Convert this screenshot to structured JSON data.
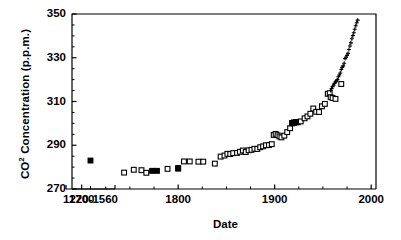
{
  "chart_data": {
    "type": "scatter",
    "title": "",
    "xlabel": "Date",
    "ylabel": "CO2 Concentration (p.p.m.)",
    "ylabel_parts": {
      "prefix": "CO",
      "superscript": "2",
      "suffix": " Concentration (p.p.m.)"
    },
    "ylim": [
      270,
      350
    ],
    "yticks": [
      270,
      290,
      310,
      330,
      350
    ],
    "ytick_labels": [
      "270",
      "290",
      "310",
      "330",
      "350"
    ],
    "xlim": [
      1690,
      2005
    ],
    "xticks": [
      1700,
      1800,
      1900,
      2000
    ],
    "xtick_labels": [
      "1700",
      "1800",
      "1900",
      "2000"
    ],
    "x_minor_ticks": [
      1725,
      1750,
      1775,
      1825,
      1850,
      1875,
      1925,
      1950,
      1975
    ],
    "broken_axis": true,
    "inset_axis_label": "1220-1560",
    "inset_xlim": [
      1220,
      1560
    ],
    "grid": false,
    "legend": "none",
    "series": [
      {
        "name": "Ice core (medieval, 1220-1560)",
        "marker": "filled-square",
        "axis": "inset",
        "points": [
          {
            "x": 1390,
            "y": 283.0
          }
        ]
      },
      {
        "name": "Ice core (open squares)",
        "marker": "open-square",
        "axis": "main",
        "points": [
          {
            "x": 1744,
            "y": 277.5
          },
          {
            "x": 1754,
            "y": 278.8
          },
          {
            "x": 1762,
            "y": 278.6
          },
          {
            "x": 1767,
            "y": 277.4
          },
          {
            "x": 1789,
            "y": 279.2
          },
          {
            "x": 1800,
            "y": 279.6
          },
          {
            "x": 1806,
            "y": 282.6
          },
          {
            "x": 1812,
            "y": 282.6
          },
          {
            "x": 1821,
            "y": 282.5
          },
          {
            "x": 1826,
            "y": 282.5
          },
          {
            "x": 1838,
            "y": 281.6
          },
          {
            "x": 1844,
            "y": 284.8
          },
          {
            "x": 1848,
            "y": 285.3
          },
          {
            "x": 1851,
            "y": 286.1
          },
          {
            "x": 1854,
            "y": 286.0
          },
          {
            "x": 1857,
            "y": 286.4
          },
          {
            "x": 1861,
            "y": 286.5
          },
          {
            "x": 1864,
            "y": 287.0
          },
          {
            "x": 1867,
            "y": 287.6
          },
          {
            "x": 1870,
            "y": 286.9
          },
          {
            "x": 1873,
            "y": 287.7
          },
          {
            "x": 1876,
            "y": 287.9
          },
          {
            "x": 1879,
            "y": 288.4
          },
          {
            "x": 1882,
            "y": 288.3
          },
          {
            "x": 1885,
            "y": 289.1
          },
          {
            "x": 1888,
            "y": 289.5
          },
          {
            "x": 1891,
            "y": 290.0
          },
          {
            "x": 1894,
            "y": 290.1
          },
          {
            "x": 1897,
            "y": 290.5
          },
          {
            "x": 1899,
            "y": 294.7
          },
          {
            "x": 1901,
            "y": 295.2
          },
          {
            "x": 1903,
            "y": 294.6
          },
          {
            "x": 1905,
            "y": 294.0
          },
          {
            "x": 1907,
            "y": 293.6
          },
          {
            "x": 1910,
            "y": 294.4
          },
          {
            "x": 1913,
            "y": 296.0
          },
          {
            "x": 1916,
            "y": 297.8
          },
          {
            "x": 1918,
            "y": 300.0
          },
          {
            "x": 1920,
            "y": 300.4
          },
          {
            "x": 1922,
            "y": 300.6
          },
          {
            "x": 1924,
            "y": 300.5
          },
          {
            "x": 1927,
            "y": 300.9
          },
          {
            "x": 1931,
            "y": 302.3
          },
          {
            "x": 1934,
            "y": 303.2
          },
          {
            "x": 1937,
            "y": 304.4
          },
          {
            "x": 1940,
            "y": 306.8
          },
          {
            "x": 1943,
            "y": 305.3
          },
          {
            "x": 1946,
            "y": 305.2
          },
          {
            "x": 1949,
            "y": 307.8
          },
          {
            "x": 1952,
            "y": 308.9
          },
          {
            "x": 1955,
            "y": 313.5
          },
          {
            "x": 1957,
            "y": 313.8
          },
          {
            "x": 1958,
            "y": 312.0
          },
          {
            "x": 1960,
            "y": 311.6
          },
          {
            "x": 1963,
            "y": 311.2
          },
          {
            "x": 1969,
            "y": 318.0
          }
        ]
      },
      {
        "name": "Ice core (filled squares)",
        "marker": "filled-square",
        "axis": "main",
        "points": [
          {
            "x": 1773,
            "y": 278.3
          },
          {
            "x": 1778,
            "y": 278.3
          },
          {
            "x": 1800,
            "y": 279.3
          },
          {
            "x": 1918,
            "y": 300.2
          },
          {
            "x": 1920,
            "y": 300.3
          },
          {
            "x": 1922,
            "y": 300.5
          }
        ]
      },
      {
        "name": "Mauna Loa instrumental record",
        "marker": "plus",
        "axis": "main",
        "points": [
          {
            "x": 1958,
            "y": 315.0
          },
          {
            "x": 1959,
            "y": 315.9
          },
          {
            "x": 1960,
            "y": 316.8
          },
          {
            "x": 1961,
            "y": 317.5
          },
          {
            "x": 1962,
            "y": 318.3
          },
          {
            "x": 1963,
            "y": 318.9
          },
          {
            "x": 1964,
            "y": 319.5
          },
          {
            "x": 1965,
            "y": 320.0
          },
          {
            "x": 1966,
            "y": 321.3
          },
          {
            "x": 1967,
            "y": 322.1
          },
          {
            "x": 1968,
            "y": 323.0
          },
          {
            "x": 1969,
            "y": 324.6
          },
          {
            "x": 1970,
            "y": 325.6
          },
          {
            "x": 1971,
            "y": 326.3
          },
          {
            "x": 1972,
            "y": 327.5
          },
          {
            "x": 1973,
            "y": 329.6
          },
          {
            "x": 1974,
            "y": 330.2
          },
          {
            "x": 1975,
            "y": 331.1
          },
          {
            "x": 1976,
            "y": 332.0
          },
          {
            "x": 1977,
            "y": 333.8
          },
          {
            "x": 1978,
            "y": 335.4
          },
          {
            "x": 1979,
            "y": 336.8
          },
          {
            "x": 1980,
            "y": 338.7
          },
          {
            "x": 1981,
            "y": 340.1
          },
          {
            "x": 1982,
            "y": 341.4
          },
          {
            "x": 1983,
            "y": 343.0
          },
          {
            "x": 1984,
            "y": 344.6
          },
          {
            "x": 1985,
            "y": 346.0
          },
          {
            "x": 1986,
            "y": 347.2
          }
        ]
      }
    ],
    "colors": {
      "marker": "#000000",
      "axis": "#000000",
      "background": "#ffffff"
    }
  }
}
